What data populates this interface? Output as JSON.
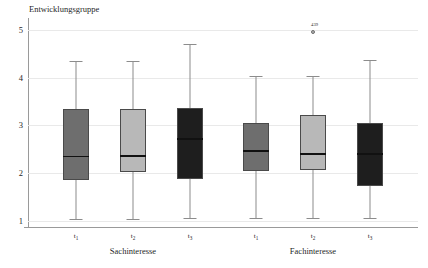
{
  "chart_data": {
    "type": "box",
    "title": "Entwicklungsgruppe",
    "xlabel": "",
    "ylabel": "",
    "ylim": [
      0.85,
      5.25
    ],
    "yticks": [
      "1",
      "2",
      "3",
      "4",
      "5"
    ],
    "ytick_values": [
      1,
      2,
      3,
      4,
      5
    ],
    "grid": true,
    "legend": "none",
    "group_labels": [
      "Sachinteresse",
      "Fachinteresse"
    ],
    "categories": [
      "t1",
      "t2",
      "t3",
      "t1",
      "t2",
      "t3"
    ],
    "boxes": [
      {
        "group": "Sachinteresse",
        "category": "t1",
        "tick_label": "t",
        "tick_sub": "1",
        "color": "#6e6e6e",
        "whisker_low": 1.03,
        "q1": 1.85,
        "median": 2.35,
        "q3": 3.35,
        "whisker_high": 4.35,
        "outliers": []
      },
      {
        "group": "Sachinteresse",
        "category": "t2",
        "tick_label": "t",
        "tick_sub": "2",
        "color": "#b8b8b8",
        "whisker_low": 1.03,
        "q1": 2.03,
        "median": 2.36,
        "q3": 3.35,
        "whisker_high": 4.35,
        "outliers": []
      },
      {
        "group": "Sachinteresse",
        "category": "t3",
        "tick_label": "t",
        "tick_sub": "3",
        "color": "#1e1e1e",
        "whisker_low": 1.05,
        "q1": 1.87,
        "median": 2.71,
        "q3": 3.36,
        "whisker_high": 4.7,
        "outliers": []
      },
      {
        "group": "Fachinteresse",
        "category": "t1",
        "tick_label": "t",
        "tick_sub": "1",
        "color": "#6e6e6e",
        "whisker_low": 1.05,
        "q1": 2.05,
        "median": 2.46,
        "q3": 3.05,
        "whisker_high": 4.04,
        "outliers": []
      },
      {
        "group": "Fachinteresse",
        "category": "t2",
        "tick_label": "t",
        "tick_sub": "2",
        "color": "#b8b8b8",
        "whisker_low": 1.06,
        "q1": 2.06,
        "median": 2.4,
        "q3": 3.22,
        "whisker_high": 4.04,
        "outliers": [
          {
            "value": 5.05,
            "label": "439"
          }
        ]
      },
      {
        "group": "Fachinteresse",
        "category": "t3",
        "tick_label": "t",
        "tick_sub": "3",
        "color": "#1e1e1e",
        "whisker_low": 1.07,
        "q1": 1.73,
        "median": 2.4,
        "q3": 3.06,
        "whisker_high": 4.38,
        "outliers": []
      }
    ]
  }
}
